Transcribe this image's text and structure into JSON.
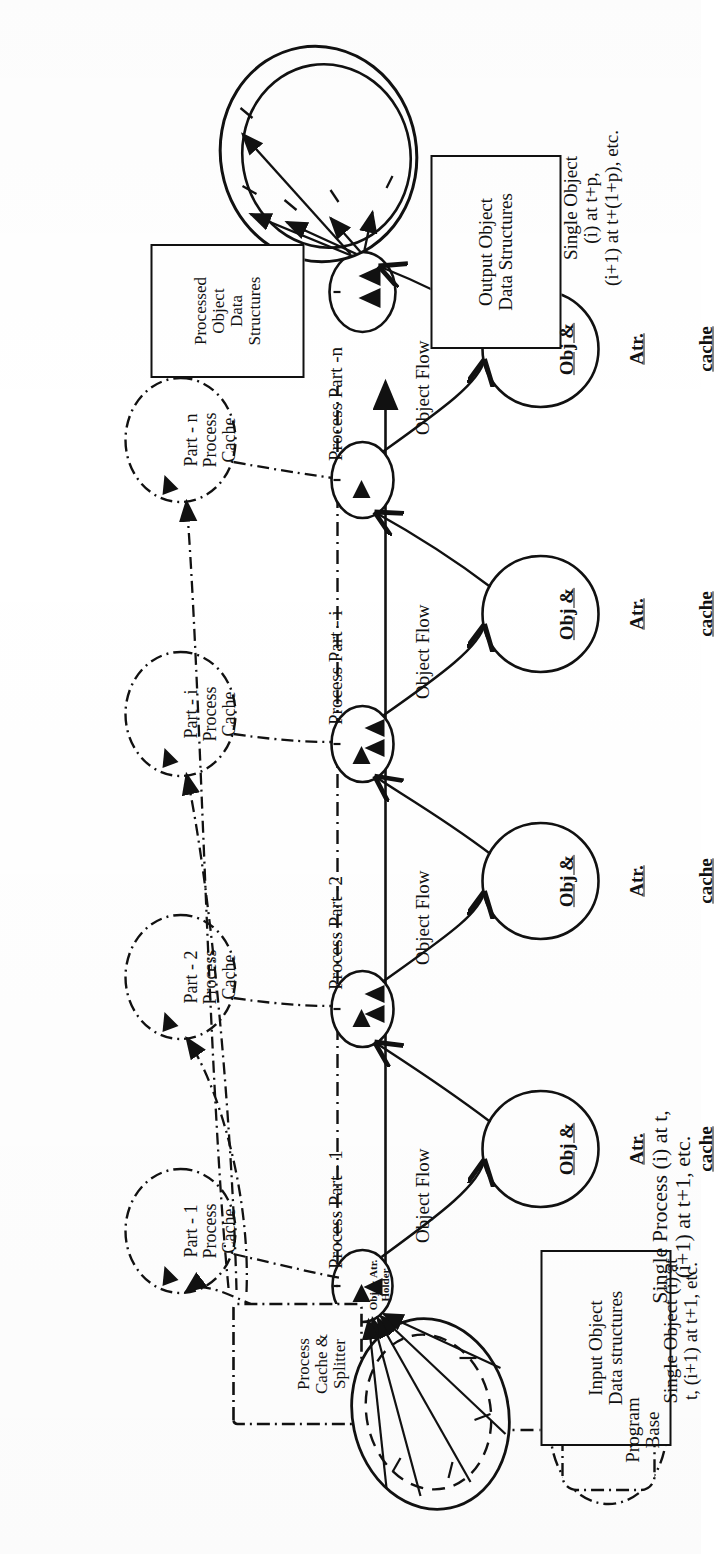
{
  "figure": {
    "orientation": "rotated-90-ccw"
  },
  "boxes": {
    "processed_object": "Processed\nObject\nData\nStructures",
    "output_object": "Output Object\nData Structures",
    "input_object": "Input Object\nData structures"
  },
  "captions": {
    "output_caption": "Single Object\n(i) at t+p,\n(i+1) at t+(1+p), etc.",
    "input_caption": "Single Object (i) at\nt, (i+1) at t+1, etc.",
    "process_caption": "Single Process (i) at t,\n(i+1) at t+1, etc."
  },
  "program_base": {
    "label": "Program\nBase"
  },
  "splitter": {
    "label": "Process\nCache &\nSplitter"
  },
  "part_caches": [
    {
      "id": "part-1",
      "label": "Part - 1\nProcess\nCache"
    },
    {
      "id": "part-2",
      "label": "Part - 2\nProcess\nCache"
    },
    {
      "id": "part-i",
      "label": "Part - i\nProcess\nCache"
    },
    {
      "id": "part-n",
      "label": "Part - n\nProcess\nCache"
    }
  ],
  "process_nodes": [
    {
      "id": "node-1",
      "inner_label": "Obj & Atr.\nHolder",
      "process_label": "Process Part - 1",
      "flow_label": "Object Flow"
    },
    {
      "id": "node-2",
      "inner_label": "",
      "process_label": "Process Part -2",
      "flow_label": "Object Flow"
    },
    {
      "id": "node-i",
      "inner_label": "",
      "process_label": "Process Part - i",
      "flow_label": "Object Flow"
    },
    {
      "id": "node-n",
      "inner_label": "",
      "process_label": "Process Part -n",
      "flow_label": "Object Flow"
    }
  ],
  "caches": [
    {
      "id": "cache-1",
      "l1": "Obj &",
      "l2": "Atr.",
      "l3": "cache"
    },
    {
      "id": "cache-2",
      "l1": "Obj &",
      "l2": "Atr.",
      "l3": "cache"
    },
    {
      "id": "cache-3",
      "l1": "Obj &",
      "l2": "Atr.",
      "l3": "cache"
    },
    {
      "id": "cache-4",
      "l1": "Obj &",
      "l2": "Atr.",
      "l3": "cache"
    }
  ],
  "colors": {
    "ink": "#111111",
    "paper": "#ffffff"
  }
}
